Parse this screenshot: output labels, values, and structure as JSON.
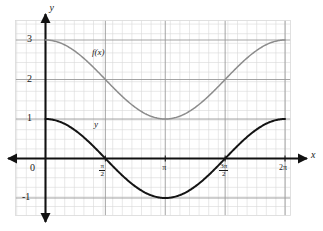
{
  "figure": {
    "title": "",
    "axis_labels": {
      "x": "x",
      "y": "y"
    },
    "curve_labels": {
      "gray": "f(x)",
      "black": "y"
    },
    "colors": {
      "black_curve": "#141414",
      "gray_curve": "#8c8c8c",
      "axis": "#111111",
      "grid_minor": "#d9d9d9",
      "grid_major": "#9a9a9a",
      "background": "#ffffff",
      "text": "#1a1a1a"
    }
  },
  "ticks": {
    "y": [
      {
        "label": "3",
        "value": 3
      },
      {
        "label": "2",
        "value": 2
      },
      {
        "label": "1",
        "value": 1
      },
      {
        "label": "0",
        "value": 0
      },
      {
        "label": "-1",
        "value": -1
      }
    ],
    "x": [
      {
        "label": "0",
        "value": 0,
        "kind": "plain"
      },
      {
        "label": "π/2",
        "num": "π",
        "den": "2",
        "value": 1.5707963,
        "kind": "fraction"
      },
      {
        "label": "π",
        "value": 3.1415927,
        "kind": "plain"
      },
      {
        "label": "3π/2",
        "num": "3π",
        "den": "2",
        "value": 4.712389,
        "kind": "fraction"
      },
      {
        "label": "2π",
        "value": 6.2831853,
        "kind": "plain"
      }
    ]
  },
  "chart_data": {
    "type": "line",
    "title": "",
    "xlabel": "x",
    "ylabel": "y",
    "xlim": [
      -0.5,
      6.8
    ],
    "ylim": [
      -1.6,
      3.6
    ],
    "grid": true,
    "legend": "inline-labels",
    "xtick_labels": [
      "0",
      "π/2",
      "π",
      "3π/2",
      "2π"
    ],
    "xtick_values": [
      0,
      1.5707963,
      3.1415927,
      4.712389,
      6.2831853
    ],
    "ytick_labels": [
      "-1",
      "0",
      "1",
      "2",
      "3"
    ],
    "ytick_values": [
      -1,
      0,
      1,
      2,
      3
    ],
    "series": [
      {
        "name": "y",
        "label": "y",
        "color": "#141414",
        "expression": "cos(x)",
        "amplitude": 1,
        "vertical_shift": 0,
        "period": 6.2831853,
        "x": [
          0,
          0.3926991,
          0.7853982,
          1.1780972,
          1.5707963,
          1.9634954,
          2.3561945,
          2.7488936,
          3.1415927,
          3.5342917,
          3.9269908,
          4.3196899,
          4.712389,
          5.1050881,
          5.4977871,
          5.8904862,
          6.2831853
        ],
        "values": [
          1,
          0.9239,
          0.7071,
          0.3827,
          0,
          -0.3827,
          -0.7071,
          -0.9239,
          -1,
          -0.9239,
          -0.7071,
          -0.3827,
          0,
          0.3827,
          0.7071,
          0.9239,
          1
        ]
      },
      {
        "name": "f(x)",
        "label": "f(x)",
        "color": "#8c8c8c",
        "expression": "cos(x) + 2",
        "amplitude": 1,
        "vertical_shift": 2,
        "period": 6.2831853,
        "x": [
          0,
          0.3926991,
          0.7853982,
          1.1780972,
          1.5707963,
          1.9634954,
          2.3561945,
          2.7488936,
          3.1415927,
          3.5342917,
          3.9269908,
          4.3196899,
          4.712389,
          5.1050881,
          5.4977871,
          5.8904862,
          6.2831853
        ],
        "values": [
          3,
          2.9239,
          2.7071,
          2.3827,
          2,
          1.6173,
          1.2929,
          1.0761,
          1,
          1.0761,
          1.2929,
          1.6173,
          2,
          2.3827,
          2.7071,
          2.9239,
          3
        ]
      }
    ]
  }
}
